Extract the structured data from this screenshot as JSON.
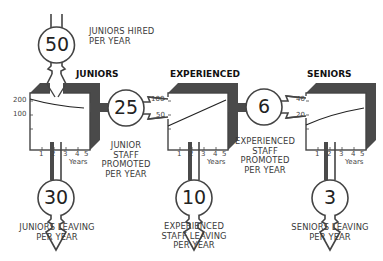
{
  "diagram": {
    "type": "stock-and-flow",
    "colors": {
      "outline": "#444444",
      "shadow": "#4a4a4a",
      "text": "#333333"
    },
    "inflow": {
      "value": "50",
      "label_line1": "JUNIORS HIRED",
      "label_line2": "PER YEAR"
    },
    "stocks": [
      {
        "name": "JUNIORS",
        "y_ticks": [
          "200",
          "100"
        ],
        "x_ticks": [
          "1",
          "2",
          "3",
          "4",
          "5"
        ],
        "x_unit": "Years",
        "trend": "decreasing"
      },
      {
        "name": "EXPERIENCED",
        "y_ticks": [
          "100",
          "50"
        ],
        "x_ticks": [
          "1",
          "2",
          "3",
          "4",
          "5"
        ],
        "x_unit": "Years",
        "trend": "increasing"
      },
      {
        "name": "SENIORS",
        "y_ticks": [
          "40",
          "20"
        ],
        "x_ticks": [
          "1",
          "2",
          "3",
          "4",
          "5"
        ],
        "x_unit": "Years",
        "trend": "increasing"
      }
    ],
    "transfers": [
      {
        "value": "25",
        "label_line1": "JUNIOR",
        "label_line2": "STAFF",
        "label_line3": "PROMOTED",
        "label_line4": "PER YEAR"
      },
      {
        "value": "6",
        "label_line1": "EXPERIENCED",
        "label_line2": "STAFF",
        "label_line3": "PROMOTED",
        "label_line4": "PER YEAR"
      }
    ],
    "outflows": [
      {
        "value": "30",
        "label_line1": "JUNIORS LEAVING",
        "label_line2": "PER YEAR"
      },
      {
        "value": "10",
        "label_line1": "EXPERIENCED",
        "label_line2": "STAFF LEAVING",
        "label_line3": "PER YEAR"
      },
      {
        "value": "3",
        "label_line1": "SENIORS LEAVING",
        "label_line2": "PER YEAR"
      }
    ]
  }
}
